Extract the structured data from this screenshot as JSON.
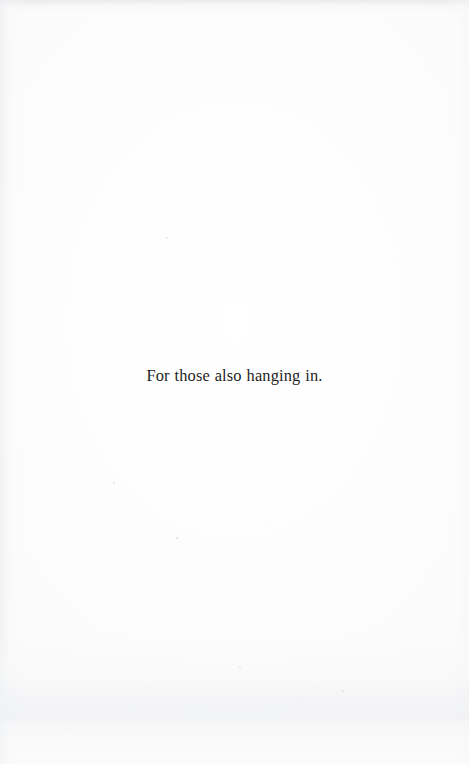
{
  "page": {
    "kind": "scanned-book-page",
    "section": "dedication",
    "background_color": "#fefefe",
    "ink_color": "#1f1f1f",
    "width": 469,
    "height": 764
  },
  "content": {
    "dedication_text": "For those also hanging in."
  },
  "artifacts": {
    "specks": [
      {
        "x": 166,
        "y": 237,
        "size": 1.6,
        "opacity": 0.22
      },
      {
        "x": 395,
        "y": 130,
        "size": 1.4,
        "opacity": 0.2
      },
      {
        "x": 440,
        "y": 160,
        "size": 1.3,
        "opacity": 0.18
      },
      {
        "x": 113,
        "y": 482,
        "size": 1.5,
        "opacity": 0.24
      },
      {
        "x": 176,
        "y": 537,
        "size": 2.2,
        "opacity": 0.3
      },
      {
        "x": 270,
        "y": 525,
        "size": 1.3,
        "opacity": 0.18
      },
      {
        "x": 271,
        "y": 488,
        "size": 1.2,
        "opacity": 0.17
      },
      {
        "x": 180,
        "y": 578,
        "size": 1.4,
        "opacity": 0.2
      },
      {
        "x": 324,
        "y": 563,
        "size": 1.3,
        "opacity": 0.17
      },
      {
        "x": 340,
        "y": 558,
        "size": 1.2,
        "opacity": 0.16
      },
      {
        "x": 239,
        "y": 666,
        "size": 1.8,
        "opacity": 0.22
      },
      {
        "x": 342,
        "y": 690,
        "size": 1.5,
        "opacity": 0.19
      },
      {
        "x": 301,
        "y": 700,
        "size": 1.3,
        "opacity": 0.16
      },
      {
        "x": 70,
        "y": 728,
        "size": 1.4,
        "opacity": 0.18
      },
      {
        "x": 143,
        "y": 759,
        "size": 1.3,
        "opacity": 0.15
      },
      {
        "x": 364,
        "y": 750,
        "size": 1.4,
        "opacity": 0.16
      },
      {
        "x": 31,
        "y": 55,
        "size": 1.2,
        "opacity": 0.15
      },
      {
        "x": 452,
        "y": 230,
        "size": 1.2,
        "opacity": 0.14
      }
    ]
  }
}
